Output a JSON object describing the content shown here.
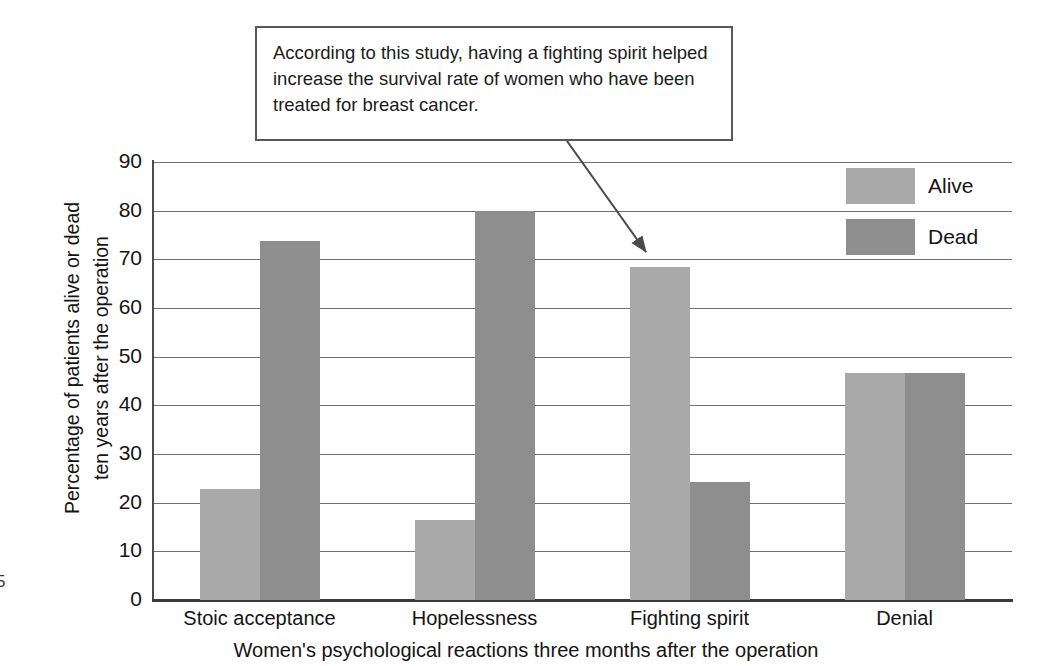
{
  "page_number": "5",
  "callout": {
    "text": "According to this study, having a fighting spirit helped increase the survival rate of women who have been treated for breast cancer."
  },
  "legend": {
    "alive_label": "Alive",
    "dead_label": "Dead"
  },
  "colors": {
    "alive": "#a9a9a9",
    "dead": "#8e8e8e",
    "gridline": "#6e6e70",
    "axis": "#3a3a3c",
    "callout_border": "#58585a",
    "text": "#141414"
  },
  "chart_data": {
    "type": "bar",
    "title": "",
    "categories": [
      "Stoic acceptance",
      "Hopelessness",
      "Fighting spirit",
      "Denial"
    ],
    "series": [
      {
        "name": "Alive",
        "values": [
          22.8,
          16.4,
          68.5,
          46.6
        ],
        "color": "#a9a9a9"
      },
      {
        "name": "Dead",
        "values": [
          73.7,
          80.0,
          24.3,
          46.6
        ],
        "color": "#8e8e8e"
      }
    ],
    "xlabel": "Women's psychological reactions three months after the operation",
    "ylabel": "Percentage of patients alive or dead ten years after the operation",
    "ylabel_lines": [
      "Percentage of patients alive or dead",
      "ten years after the operation"
    ],
    "ylim": [
      0,
      90
    ],
    "ytick_values": [
      0,
      10,
      20,
      30,
      40,
      50,
      60,
      70,
      80,
      90
    ],
    "ytick_labels": [
      "0",
      "10",
      "20",
      "30",
      "40",
      "50",
      "60",
      "70",
      "80",
      "90"
    ],
    "grid": true,
    "legend_position": "top-right",
    "annotations": [
      {
        "text": "According to this study, having a fighting spirit helped increase the survival rate of women who have been treated for breast cancer.",
        "points_to": "Fighting spirit / Alive"
      }
    ]
  }
}
